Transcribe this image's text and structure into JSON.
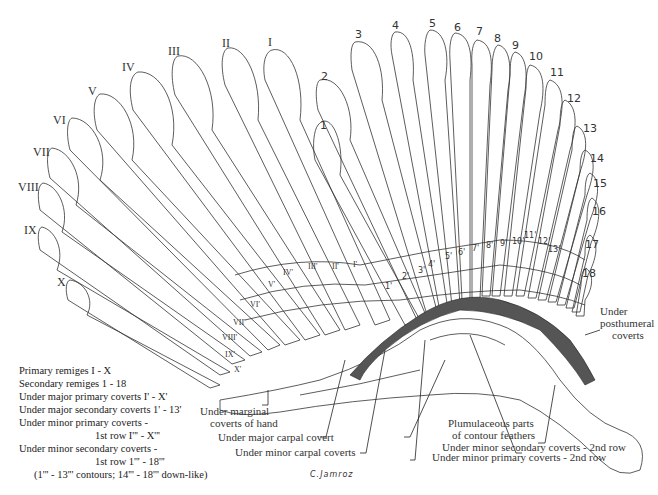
{
  "diagram": {
    "primaries": [
      "I",
      "II",
      "III",
      "IV",
      "V",
      "VI",
      "VII",
      "VIII",
      "IX",
      "X"
    ],
    "secondaries": [
      "1",
      "2",
      "3",
      "4",
      "5",
      "6",
      "7",
      "8",
      "9",
      "10",
      "11",
      "12",
      "13",
      "14",
      "15",
      "16",
      "17",
      "18"
    ],
    "major_primary_coverts": [
      "I'",
      "II'",
      "III'",
      "IV'",
      "V'",
      "VI'",
      "VII'",
      "VIII'",
      "IX'",
      "X'"
    ],
    "major_secondary_coverts": [
      "1'",
      "2'",
      "3'",
      "4'",
      "5'",
      "6'",
      "7'",
      "8'",
      "9'",
      "10'",
      "11'",
      "12'",
      "13'"
    ],
    "minor_primary_coverts_row1": [
      "I'''",
      "II'''",
      "III'''",
      "IV'''",
      "V'''",
      "VI'''",
      "VII'''",
      "VIII'''",
      "IX'''",
      "X'''"
    ],
    "minor_secondary_coverts_row1": [
      "1'''",
      "2'''",
      "3'''",
      "4'''",
      "5'''",
      "6'''",
      "7'''",
      "8'''",
      "9'''",
      "10'''",
      "11'''",
      "12'''",
      "13'''",
      "14'''",
      "15'''",
      "16'''",
      "17'''",
      "18'''"
    ]
  },
  "legend": {
    "line1": "Primary remiges  I - X",
    "line2": "Secondary remiges  1 - 18",
    "line3": "Under major primary coverts  I' - X'",
    "line4": "Under major secondary coverts  1' - 13'",
    "line5": "Under minor primary coverts -",
    "line6": "1st row  I''' - X'''",
    "line7": "Under minor secondary coverts -",
    "line8": "1st row  1''' - 18'''",
    "line9": "(1''' - 13''' contours; 14''' - 18''' down-like)"
  },
  "callouts": {
    "marginal": "Under marginal coverts of hand",
    "marginal_l1": "Under marginal",
    "marginal_l2": "coverts of hand",
    "major_carpal": "Under major carpal covert",
    "minor_carpal": "Under minor carpal coverts",
    "plumulaceous_l1": "Plumulaceous parts",
    "plumulaceous_l2": "of contour feathers",
    "minor_secondary_2nd": "Under minor secondary coverts - 2nd row",
    "minor_primary_2nd": "Under minor primary coverts - 2nd row",
    "posthumeral_l1": "Under",
    "posthumeral_l2": "posthumeral",
    "posthumeral_l3": "coverts"
  },
  "signature": "C.Jamroz"
}
